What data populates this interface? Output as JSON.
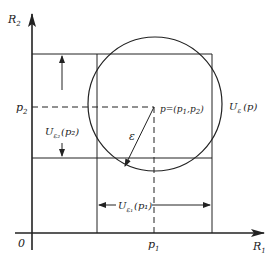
{
  "diagram": {
    "title": "",
    "colors": {
      "ink": "#222222",
      "background": "#ffffff"
    },
    "axes": {
      "x_label": "R",
      "x_label_sub": "1",
      "y_label": "R",
      "y_label_sub": "2",
      "origin_label": "0"
    },
    "ticks": {
      "x_tick": "p",
      "x_tick_sub": "1",
      "y_tick": "p",
      "y_tick_sub": "2"
    },
    "point": {
      "label_prefix": "p=(p",
      "sub1": "1",
      "mid": ",p",
      "sub2": "2",
      "suffix": ")"
    },
    "circle": {
      "label": "U",
      "label_sub": "ε",
      "label_arg": "(p)"
    },
    "radius": {
      "label": "ε"
    },
    "vertical_interval": {
      "label": "U",
      "label_sub": "ε₂",
      "label_arg": "(p₂)"
    },
    "horizontal_interval": {
      "label": "U",
      "label_sub": "ε₁",
      "label_arg": "(p₁)"
    }
  }
}
